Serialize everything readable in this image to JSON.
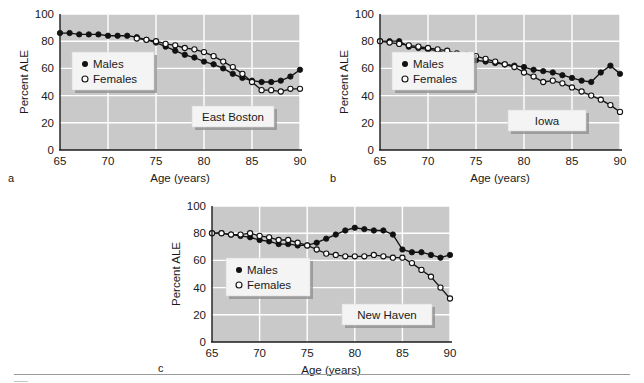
{
  "figure": {
    "panels": [
      {
        "letter": "a",
        "site_label": "East Boston",
        "ylabel": "Percent ALE",
        "xlabel": "Age (years)",
        "legend": [
          "Males",
          "Females"
        ]
      },
      {
        "letter": "b",
        "site_label": "Iowa",
        "ylabel": "Percent ALE",
        "xlabel": "Age (years)",
        "legend": [
          "Males",
          "Females"
        ]
      },
      {
        "letter": "c",
        "site_label": "New Haven",
        "ylabel": "Percent ALE",
        "xlabel": "Age (years)",
        "legend": [
          "Males",
          "Females"
        ]
      }
    ],
    "y_ticks": [
      "0",
      "20",
      "40",
      "60",
      "80",
      "100"
    ],
    "x_ticks": [
      "65",
      "70",
      "75",
      "80",
      "85",
      "90"
    ],
    "colors": {
      "plot_background": "#c9c9c9",
      "grid": "#ffffff",
      "series": "#111111",
      "axis": "#1a1a1a",
      "box_fill": "#f4f4f4",
      "box_shadow": "#8c8c8c"
    }
  },
  "chart_data": [
    {
      "type": "line",
      "title": "East Boston",
      "panel": "a",
      "xlabel": "Age (years)",
      "ylabel": "Percent ALE",
      "xlim": [
        65,
        90
      ],
      "ylim": [
        0,
        100
      ],
      "grid": true,
      "legend_position": "upper-left-inset",
      "x": [
        65,
        66,
        67,
        68,
        69,
        70,
        71,
        72,
        73,
        74,
        75,
        76,
        77,
        78,
        79,
        80,
        81,
        82,
        83,
        84,
        85,
        86,
        87,
        88,
        89,
        90
      ],
      "series": [
        {
          "name": "Males",
          "marker": "filled-circle",
          "values": [
            86,
            86,
            85,
            85,
            85,
            84,
            84,
            84,
            83,
            81,
            79,
            76,
            73,
            70,
            68,
            65,
            63,
            60,
            56,
            53,
            51,
            50,
            50,
            51,
            54,
            59
          ]
        },
        {
          "name": "Females",
          "marker": "open-circle",
          "values": [
            null,
            null,
            null,
            null,
            null,
            null,
            null,
            null,
            82,
            81,
            80,
            78,
            77,
            75,
            74,
            72,
            69,
            65,
            61,
            56,
            50,
            44,
            44,
            43,
            45,
            45
          ]
        }
      ]
    },
    {
      "type": "line",
      "title": "Iowa",
      "panel": "b",
      "xlabel": "Age (years)",
      "ylabel": "Percent ALE",
      "xlim": [
        65,
        90
      ],
      "ylim": [
        0,
        100
      ],
      "grid": true,
      "legend_position": "upper-left-inset",
      "x": [
        65,
        66,
        67,
        68,
        69,
        70,
        71,
        72,
        73,
        74,
        75,
        76,
        77,
        78,
        79,
        80,
        81,
        82,
        83,
        84,
        85,
        86,
        87,
        88,
        89,
        90
      ],
      "series": [
        {
          "name": "Males",
          "marker": "filled-circle",
          "values": [
            80,
            80,
            80,
            76,
            75,
            74,
            73,
            71,
            69,
            68,
            66,
            65,
            64,
            63,
            62,
            61,
            59,
            58,
            57,
            55,
            53,
            51,
            50,
            57,
            62,
            56
          ]
        },
        {
          "name": "Females",
          "marker": "open-circle",
          "values": [
            80,
            79,
            78,
            77,
            76,
            75,
            74,
            73,
            71,
            70,
            69,
            67,
            65,
            63,
            61,
            57,
            54,
            50,
            51,
            49,
            46,
            43,
            40,
            37,
            33,
            28
          ]
        }
      ]
    },
    {
      "type": "line",
      "title": "New Haven",
      "panel": "c",
      "xlabel": "Age (years)",
      "ylabel": "Percent ALE",
      "xlim": [
        65,
        90
      ],
      "ylim": [
        0,
        100
      ],
      "grid": true,
      "legend_position": "upper-left-inset",
      "x": [
        65,
        66,
        67,
        68,
        69,
        70,
        71,
        72,
        73,
        74,
        75,
        76,
        77,
        78,
        79,
        80,
        81,
        82,
        83,
        84,
        85,
        86,
        87,
        88,
        89,
        90
      ],
      "series": [
        {
          "name": "Males",
          "marker": "filled-circle",
          "values": [
            80,
            80,
            79,
            78,
            77,
            75,
            74,
            72,
            72,
            71,
            71,
            73,
            76,
            79,
            82,
            84,
            83,
            82,
            82,
            79,
            68,
            66,
            66,
            64,
            62,
            64
          ]
        },
        {
          "name": "Females",
          "marker": "open-circle",
          "values": [
            80,
            80,
            79,
            79,
            80,
            78,
            77,
            75,
            75,
            73,
            71,
            68,
            65,
            64,
            63,
            63,
            63,
            64,
            63,
            62,
            62,
            58,
            53,
            48,
            40,
            32
          ]
        }
      ]
    }
  ]
}
